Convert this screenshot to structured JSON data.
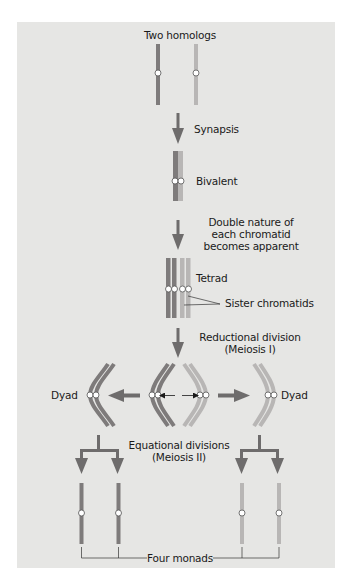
{
  "colors": {
    "panel_bg": "#e6e6e4",
    "dark_chromosome": "#7e7b7b",
    "light_chromosome": "#b8b6b5",
    "arrow": "#6e6c6c",
    "centromere": "#ffffff",
    "text": "#1a1a1a"
  },
  "labels": {
    "two_homologs": "Two homologs",
    "synapsis": "Synapsis",
    "bivalent": "Bivalent",
    "double_nature_1": "Double nature of",
    "double_nature_2": "each chromatid",
    "double_nature_3": "becomes apparent",
    "tetrad": "Tetrad",
    "sister_chromatids": "Sister chromatids",
    "reductional_1": "Reductional division",
    "reductional_2": "(Meiosis I)",
    "dyad_left": "Dyad",
    "dyad_right": "Dyad",
    "equational_1": "Equational divisions",
    "equational_2": "(Meiosis II)",
    "four_monads": "Four monads"
  },
  "stages": [
    {
      "name": "Two homologs",
      "step": 1
    },
    {
      "name": "Synapsis",
      "step": 2
    },
    {
      "name": "Bivalent",
      "step": 3
    },
    {
      "name": "Double nature of each chromatid becomes apparent",
      "step": 4
    },
    {
      "name": "Tetrad",
      "step": 5
    },
    {
      "name": "Reductional division (Meiosis I)",
      "step": 6
    },
    {
      "name": "Dyad",
      "step": 7
    },
    {
      "name": "Equational divisions (Meiosis II)",
      "step": 8
    },
    {
      "name": "Four monads",
      "step": 9
    }
  ]
}
